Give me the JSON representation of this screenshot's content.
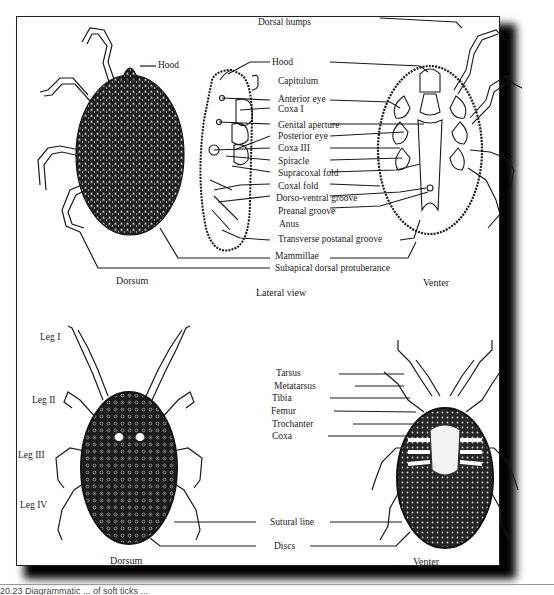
{
  "figure": {
    "caption_fragment": "20.23   Diagrammatic ... of soft ticks ...",
    "panels": {
      "top": {
        "name": "Argasid soft tick",
        "views": {
          "dorsum": "Dorsum",
          "lateral": "Lateral view",
          "venter": "Venter"
        },
        "labels": [
          "Dorsal humps",
          "Hood",
          "Hood",
          "Capitulum",
          "Anterior eye",
          "Coxa I",
          "Genital aperture",
          "Posterior eye",
          "Coxa III",
          "Spiracle",
          "Supracoxal fold",
          "Coxal fold",
          "Dorso-ventral groove",
          "Preanal groove",
          "Anus",
          "Transverse postanal groove",
          "Mammillae",
          "Subapical dorsal protuberance"
        ]
      },
      "bottom": {
        "name": "Hard tick",
        "views": {
          "dorsum": "Dorsum",
          "venter": "Venter"
        },
        "leg_labels": [
          "Leg I",
          "Leg II",
          "Leg III",
          "Leg IV"
        ],
        "segment_labels": [
          "Tarsus",
          "Metatarsus",
          "Tibia",
          "Femur",
          "Trochanter",
          "Coxa"
        ],
        "other_labels": [
          "Sutural line",
          "Discs"
        ]
      }
    },
    "colors": {
      "ink": "#1a1a1a",
      "body_fill": "#2b2b2b",
      "paper": "#ffffff",
      "shadow": "#000000"
    }
  }
}
